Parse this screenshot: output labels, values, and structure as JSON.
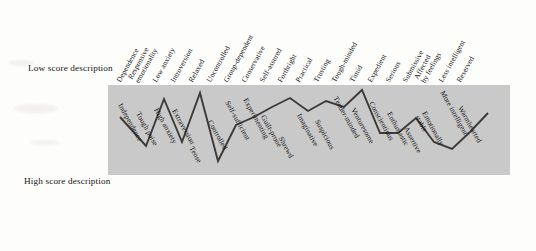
{
  "figure": {
    "low_score_label": "Low score description",
    "high_score_label": "High score description",
    "plot_background": "#c9c9c9",
    "line_color": "#3a3a3a"
  },
  "chart_data": {
    "type": "line",
    "title": "",
    "subtitle": "",
    "xlabel": "",
    "ylabel": "",
    "grid": false,
    "legend": "none",
    "axis_top_label": "Low score description",
    "axis_bottom_label": "High score description",
    "ylim": [
      1,
      10
    ],
    "y_direction": "low score at top, high score at bottom",
    "n_factors": 21,
    "categories_low": [
      "Dependence",
      "Responsive emotionality",
      "Low anxiety",
      "Introversion",
      "Relaxed",
      "Uncontrolled",
      "Group-dependent",
      "Conservative",
      "Self-assured",
      "Forthright",
      "Practical",
      "Trusting",
      "Tough-minded",
      "Timid",
      "Expedient",
      "Serious",
      "Submissive",
      "Affected by feelings",
      "Less intelligent",
      "Reserved"
    ],
    "categories_high": [
      "Independence",
      "Tough poise",
      "High anxiety",
      "Extraversion",
      "Tense",
      "Controlled",
      "Self-sufficient",
      "Experimenting",
      "Guilt-prone",
      "Shrewd",
      "Imaginative",
      "Suspicious",
      "Tender-minded",
      "Venturesome",
      "Conscientious",
      "Enthusiastic",
      "Assertive",
      "Emotionally stable",
      "More intelligent",
      "Warmhearted"
    ],
    "categories_low_display": [
      {
        "l1": "Dependence",
        "l2": ""
      },
      {
        "l1": "Responsive",
        "l2": "emotionality"
      },
      {
        "l1": "Low anxiety",
        "l2": ""
      },
      {
        "l1": "Introversion",
        "l2": ""
      },
      {
        "l1": "Relaxed",
        "l2": ""
      },
      {
        "l1": "Uncontrolled",
        "l2": ""
      },
      {
        "l1": "Group-dependent",
        "l2": ""
      },
      {
        "l1": "Conservative",
        "l2": ""
      },
      {
        "l1": "Self-assured",
        "l2": ""
      },
      {
        "l1": "Forthright",
        "l2": ""
      },
      {
        "l1": "Practical",
        "l2": ""
      },
      {
        "l1": "Trusting",
        "l2": ""
      },
      {
        "l1": "Tough-minded",
        "l2": ""
      },
      {
        "l1": "Timid",
        "l2": ""
      },
      {
        "l1": "Expedient",
        "l2": ""
      },
      {
        "l1": "Serious",
        "l2": ""
      },
      {
        "l1": "Submissive",
        "l2": ""
      },
      {
        "l1": "Affected",
        "l2": "by feelings"
      },
      {
        "l1": "Less intelligent",
        "l2": ""
      },
      {
        "l1": "Reserved",
        "l2": ""
      }
    ],
    "categories_high_display": [
      {
        "l1": "Independence",
        "l2": ""
      },
      {
        "l1": "Tough poise",
        "l2": ""
      },
      {
        "l1": "High anxiety",
        "l2": ""
      },
      {
        "l1": "Extraversion",
        "l2": ""
      },
      {
        "l1": "Tense",
        "l2": ""
      },
      {
        "l1": "Controlled",
        "l2": ""
      },
      {
        "l1": "Self-sufficient",
        "l2": ""
      },
      {
        "l1": "Experimenting",
        "l2": ""
      },
      {
        "l1": "Guilt-prone",
        "l2": ""
      },
      {
        "l1": "Shrewd",
        "l2": ""
      },
      {
        "l1": "Imaginative",
        "l2": ""
      },
      {
        "l1": "Suspicious",
        "l2": ""
      },
      {
        "l1": "Tender-minded",
        "l2": ""
      },
      {
        "l1": "Venturesome",
        "l2": ""
      },
      {
        "l1": "Conscientious",
        "l2": ""
      },
      {
        "l1": "Enthusiastic",
        "l2": ""
      },
      {
        "l1": "Assertive",
        "l2": ""
      },
      {
        "l1": "Emotionally",
        "l2": "stable"
      },
      {
        "l1": "More intelligent",
        "l2": ""
      },
      {
        "l1": "Warmhearted",
        "l2": ""
      }
    ],
    "x": [
      1,
      2,
      3,
      4,
      5,
      6,
      7,
      8,
      9,
      10,
      11,
      12,
      13,
      14,
      15,
      16,
      17,
      18,
      19,
      20,
      21
    ],
    "values": [
      4.2,
      5.8,
      6.4,
      1.9,
      6.2,
      1.5,
      8.1,
      5.4,
      4.2,
      2.7,
      3.3,
      2.1,
      3.0,
      2.4,
      1.3,
      6.4,
      6.4,
      3.4,
      7.3,
      6.6,
      2.6
    ],
    "series": [
      {
        "name": "Profile",
        "values": [
          4.2,
          5.8,
          6.4,
          1.9,
          6.2,
          1.5,
          8.1,
          5.4,
          4.2,
          2.7,
          3.3,
          2.1,
          3.0,
          2.4,
          1.3,
          6.4,
          6.4,
          3.4,
          7.3,
          6.6,
          2.6
        ]
      }
    ],
    "points_px": [
      [
        12,
        32
      ],
      [
        30,
        52
      ],
      [
        38,
        61
      ],
      [
        56,
        14
      ],
      [
        74,
        57
      ],
      [
        92,
        8
      ],
      [
        110,
        76
      ],
      [
        128,
        40
      ],
      [
        146,
        32
      ],
      [
        164,
        22
      ],
      [
        182,
        13
      ],
      [
        200,
        26
      ],
      [
        218,
        16
      ],
      [
        236,
        22
      ],
      [
        254,
        5
      ],
      [
        272,
        48
      ],
      [
        290,
        48
      ],
      [
        308,
        33
      ],
      [
        326,
        57
      ],
      [
        344,
        64
      ],
      [
        362,
        47
      ],
      [
        380,
        28
      ]
    ]
  }
}
